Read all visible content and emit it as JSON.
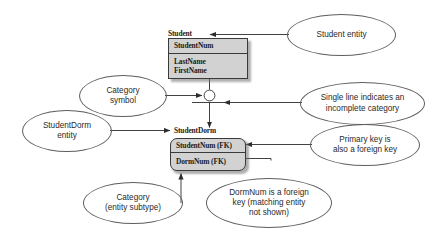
{
  "diagram": {
    "background_color": "#ffffff",
    "line_color": "#3a3a3a",
    "entity_fill_color": "#d2d2d2",
    "callout_stroke_color": "#5e5e5e"
  },
  "entities": [
    {
      "id": "student",
      "name": "Student",
      "shape": "rectangle",
      "compartments": [
        {
          "id": "student-key",
          "attributes": [
            "StudentNum"
          ]
        },
        {
          "id": "student-attrs",
          "attributes": [
            "LastName",
            "FirstName"
          ]
        }
      ]
    },
    {
      "id": "studentdorm",
      "name": "StudentDorm",
      "shape": "rounded-rectangle",
      "compartments": [
        {
          "id": "studentdorm-key",
          "attributes": [
            "StudentNum (FK)"
          ]
        },
        {
          "id": "studentdorm-fk",
          "attributes": [
            "DormNum (FK)"
          ]
        }
      ]
    }
  ],
  "symbols": [
    {
      "id": "category-circle",
      "name": "category-symbol",
      "description": "circle with single line indicating incomplete category"
    }
  ],
  "callouts": [
    {
      "id": "student-entity",
      "text": "Student entity"
    },
    {
      "id": "category-symbol",
      "text": "Category\nsymbol"
    },
    {
      "id": "incomplete-category",
      "text": "Single line indicates an\nincomplete category"
    },
    {
      "id": "studentdorm-entity",
      "text": "StudentDorm\nentity"
    },
    {
      "id": "primary-foreign-key",
      "text": "Primary key is\nalso a foreign key"
    },
    {
      "id": "category-subtype",
      "text": "Category\n(entity subtype)"
    },
    {
      "id": "dormnum-foreign-key",
      "text": "DormNum is a foreign\nkey (matching entity\nnot shown)"
    }
  ]
}
